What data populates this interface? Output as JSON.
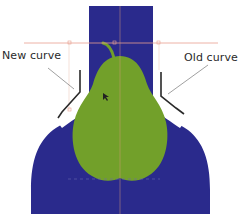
{
  "labels": {
    "new_curve": "New curve",
    "old_curve": "Old curve"
  },
  "colors": {
    "background": "#ffffff",
    "vase_blue": "#2a2a8c",
    "pear_green": "#72a02a",
    "guide_line": "#e8a090",
    "outline": "#2a2a2a",
    "leader": "#777777"
  }
}
